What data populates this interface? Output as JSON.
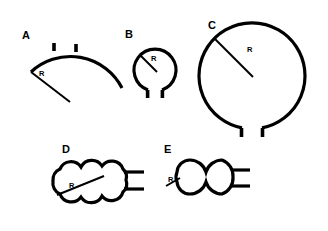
{
  "figure": {
    "title": "",
    "background_color": "#ffffff",
    "stroke_color": "#000000",
    "width": 328,
    "height": 231,
    "panels": [
      {
        "id": "A",
        "label": "A",
        "label_x": 22,
        "label_y": 39,
        "shape_name": "open-arc-sector",
        "description": "Shallow open arc (sector) with two short inward tick marks and a straight radius line extending down-right from the left arc endpoint",
        "radius_label": "R",
        "radius_label_x": 39,
        "radius_label_y": 76,
        "tick_count": 2,
        "lobe_count": 0
      },
      {
        "id": "B",
        "label": "B",
        "label_x": 125,
        "label_y": 38,
        "shape_name": "small-circle-with-two-tabs",
        "description": "Small near-closed circle with a gap at the bottom; both arc ends terminate in short vertical tabs. Radius line drawn from upper-left of circle to center",
        "radius_label": "R",
        "radius_label_x": 151,
        "radius_label_y": 61,
        "tick_count": 2,
        "lobe_count": 1
      },
      {
        "id": "C",
        "label": "C",
        "label_x": 208,
        "label_y": 29,
        "shape_name": "large-circle-with-two-tabs",
        "description": "Large near-closed circle with a gap at the bottom; both arc ends terminate in short vertical tabs. Radius line drawn from upper-left of circle to center",
        "radius_label": "R",
        "radius_label_x": 247,
        "radius_label_y": 52,
        "tick_count": 2,
        "lobe_count": 1
      },
      {
        "id": "D",
        "label": "D",
        "label_x": 62,
        "label_y": 153,
        "shape_name": "scalloped-cloud-shape",
        "description": "Cloud-like scalloped closed outline with convex bumps along top and bottom; two short horizontal line stubs extend to the right. Radius line drawn from lower-left toward the interior",
        "radius_label": "R",
        "radius_label_x": 69,
        "radius_label_y": 188,
        "tick_count": 2,
        "lobe_count": 8
      },
      {
        "id": "E",
        "label": "E",
        "label_x": 164,
        "label_y": 153,
        "shape_name": "cloverleaf-lobed-shape",
        "description": "Flower / cloverleaf outline made of five large circular lobes with sharp cusps between them; two short horizontal line stubs extend to the right. Radius line drawn inside the small left lobe",
        "radius_label": "R",
        "radius_label_x": 168,
        "radius_label_y": 182,
        "tick_count": 2,
        "lobe_count": 5
      }
    ]
  }
}
